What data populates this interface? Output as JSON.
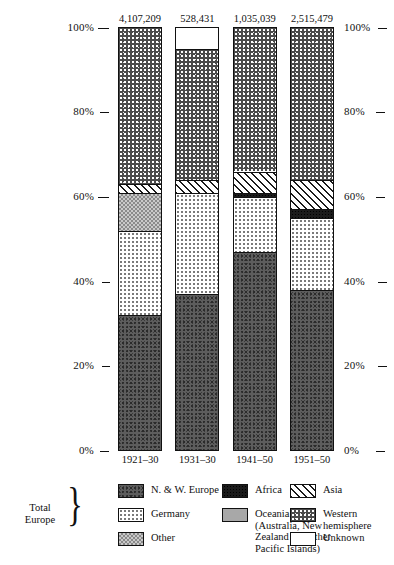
{
  "chart_data": {
    "type": "bar",
    "subtype": "stacked-percentage",
    "title": "",
    "xlabel": "",
    "ylabel": "",
    "ylim": [
      0,
      100
    ],
    "ytick_labels": [
      "0%",
      "20%",
      "40%",
      "60%",
      "80%",
      "100%"
    ],
    "ytick_values": [
      0,
      20,
      40,
      60,
      80,
      100
    ],
    "grid": false,
    "legend_position": "bottom",
    "categories": [
      "1921–30",
      "1931–30",
      "1941–50",
      "1951–50"
    ],
    "bar_totals": [
      "4,107,209",
      "528,431",
      "1,035,039",
      "2,515,479"
    ],
    "series": [
      {
        "name": "N. & W. Europe",
        "pattern": "p-nw",
        "values": [
          32,
          37,
          47,
          38
        ]
      },
      {
        "name": "Germany",
        "pattern": "p-germany",
        "values": [
          20,
          24,
          13,
          17
        ]
      },
      {
        "name": "Other",
        "pattern": "p-other",
        "values": [
          9,
          0,
          0,
          0
        ]
      },
      {
        "name": "Africa",
        "pattern": "p-africa",
        "values": [
          0,
          0,
          1,
          2
        ]
      },
      {
        "name": "Oceania",
        "pattern": "p-oceania",
        "values": [
          0,
          0,
          0,
          0
        ]
      },
      {
        "name": "Asia",
        "pattern": "p-asia",
        "values": [
          2,
          3,
          5,
          7
        ]
      },
      {
        "name": "Western hemisphere",
        "pattern": "p-west",
        "values": [
          37,
          31,
          34,
          36
        ]
      },
      {
        "name": "Unknown",
        "pattern": "p-unknown",
        "values": [
          0,
          5,
          0,
          0
        ]
      }
    ],
    "stack_order_bottom_to_top": [
      "N. & W. Europe",
      "Germany",
      "Other",
      "Africa",
      "Oceania",
      "Asia",
      "Western hemisphere",
      "Unknown"
    ]
  },
  "axis": {
    "left_ticks": [
      "100%",
      "80%",
      "60%",
      "40%",
      "20%",
      "0%"
    ],
    "right_ticks": [
      "100%",
      "80%",
      "60%",
      "40%",
      "20%",
      "0%"
    ]
  },
  "legend": {
    "brace_label": "Total\nEurope",
    "brace_glyph": "}",
    "items": [
      {
        "label": "N. & W. Europe",
        "pattern": "p-nw"
      },
      {
        "label": "Germany",
        "pattern": "p-germany"
      },
      {
        "label": "Other",
        "pattern": "p-other"
      },
      {
        "label": "Africa",
        "pattern": "p-africa"
      },
      {
        "label": "Oceania\n(Australia, New\nZealand and other\nPacific Islands)",
        "pattern": "p-oceania"
      },
      {
        "label": "Asia",
        "pattern": "p-asia"
      },
      {
        "label": "Western hemisphere",
        "pattern": "p-west"
      },
      {
        "label": "Unknown",
        "pattern": "p-unknown"
      }
    ]
  },
  "caption": ""
}
